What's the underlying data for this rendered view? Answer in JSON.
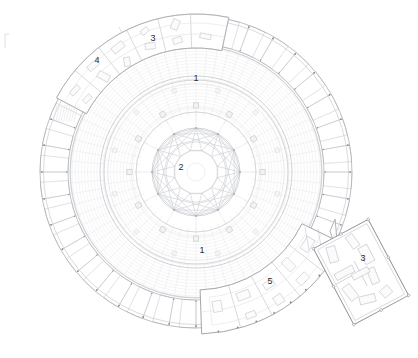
{
  "drawing": {
    "title": "Circular rotunda floor plan",
    "type": "architectural-floor-plan",
    "canvas": {
      "width": 418,
      "height": 358,
      "background": "#ffffff"
    },
    "line_colors": {
      "hairline": "#e3e4e7",
      "light": "#d6d8dc",
      "medium": "#b9bcc2",
      "dark": "#8d9096",
      "wall": "#a7aab0",
      "text": "#2b2b2b"
    }
  },
  "geometry": {
    "rotunda": {
      "center_x": 196,
      "center_y": 172,
      "outer_radius": 156,
      "fin_inner_radius": 128,
      "gallery_outer_radius": 126,
      "gallery_inner_radius": 96,
      "drum_radius": 92,
      "inner_ring_radius": 60,
      "medallion_radius": 44,
      "core_radius": 30,
      "radial_divisions": 48,
      "fin_count": 36
    },
    "annex": {
      "center_x": 361,
      "center_y": 272,
      "width": 62,
      "height": 86,
      "rotation_deg": -28
    },
    "wing_south": {
      "start_angle_deg": 22,
      "end_angle_deg": 76
    },
    "wing_north": {
      "start_angle_deg": 208,
      "end_angle_deg": 262
    }
  },
  "labels": [
    {
      "id": "label-1-north",
      "text": "1",
      "x": 196,
      "y": 78,
      "room": "main-hall"
    },
    {
      "id": "label-2-center",
      "text": "2",
      "x": 181,
      "y": 167,
      "room": "central-medallion"
    },
    {
      "id": "label-1-south",
      "text": "1",
      "x": 202,
      "y": 250,
      "room": "main-hall"
    },
    {
      "id": "label-3-north",
      "text": "3",
      "x": 153,
      "y": 38,
      "room": "office-north"
    },
    {
      "id": "label-4-north",
      "text": "4",
      "x": 97,
      "y": 60,
      "room": "service-north"
    },
    {
      "id": "label-5-south",
      "text": "5",
      "x": 270,
      "y": 281,
      "room": "wing-south"
    },
    {
      "id": "label-3-annex",
      "text": "3",
      "x": 363,
      "y": 258,
      "room": "annex"
    }
  ],
  "legend_numbers": [
    "1",
    "2",
    "3",
    "4",
    "5"
  ],
  "corner_mark": {
    "x": 6,
    "y": 40,
    "text": ""
  }
}
